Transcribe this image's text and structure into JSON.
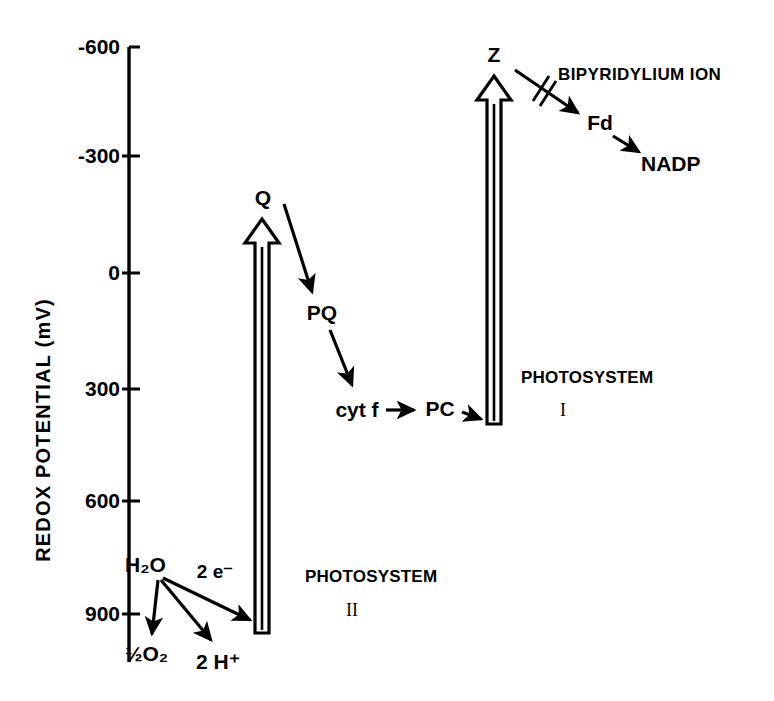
{
  "figure": {
    "type": "diagram",
    "background_color": "#ffffff",
    "ink_color": "#000000"
  },
  "axis": {
    "title_line1": "REDOX  POTENTIAL",
    "title_line2": "(mV)",
    "title_full": "REDOX  POTENTIAL   (mV)",
    "orientation": "vertical",
    "direction": "negative-at-top",
    "tick_labels": [
      "-600",
      "-300",
      "0",
      "300",
      "600",
      "900"
    ],
    "tick_values": [
      -600,
      -300,
      0,
      300,
      600,
      900
    ],
    "unit": "mV"
  },
  "photosystems": [
    {
      "key": "psii",
      "label_line1": "PHOTOSYSTEM",
      "label_line2": "II",
      "base_label": "",
      "top_label": "Q",
      "top_potential": -100,
      "base_potential": 820
    },
    {
      "key": "psi",
      "label_line1": "PHOTOSYSTEM",
      "label_line2": "I",
      "base_label": "",
      "top_label": "Z",
      "top_potential": -580,
      "base_potential": 390
    }
  ],
  "carriers": [
    {
      "key": "water",
      "label": "H2O",
      "display": "H₂O",
      "potential": 700
    },
    {
      "key": "oxygen",
      "label": "1/2 O2",
      "display": "½O₂",
      "potential": 870
    },
    {
      "key": "proton",
      "label": "2 H+",
      "display": "2 H⁺",
      "potential": 890
    },
    {
      "key": "electrons",
      "label": "2 e-",
      "display": "2 e⁻",
      "potential": 760
    },
    {
      "key": "q",
      "label": "Q",
      "display": "Q",
      "potential": -100
    },
    {
      "key": "pq",
      "label": "PQ",
      "display": "PQ",
      "potential": 100
    },
    {
      "key": "cytf",
      "label": "cyt f",
      "display": "cyt f",
      "potential": 370
    },
    {
      "key": "pc",
      "label": "PC",
      "display": "PC",
      "potential": 380
    },
    {
      "key": "z",
      "label": "Z",
      "display": "Z",
      "potential": -580
    },
    {
      "key": "fd",
      "label": "Fd",
      "display": "Fd",
      "potential": -420
    },
    {
      "key": "nadp",
      "label": "NADP",
      "display": "NADP",
      "potential": -320
    }
  ],
  "inhibitor": {
    "label": "BIPYRIDYLIUM  ION",
    "blocks_step": "Z to Fd",
    "marker": "double-slash"
  },
  "flows": [
    {
      "from": "H2O",
      "to": "1/2 O2",
      "label": ""
    },
    {
      "from": "H2O",
      "to": "2 H+",
      "label": ""
    },
    {
      "from": "H2O",
      "to": "PHOTOSYSTEM II",
      "label": "2 e-"
    },
    {
      "from": "Q",
      "to": "PQ",
      "label": ""
    },
    {
      "from": "PQ",
      "to": "cyt f",
      "label": ""
    },
    {
      "from": "cyt f",
      "to": "PC",
      "label": ""
    },
    {
      "from": "PC",
      "to": "PHOTOSYSTEM I",
      "label": ""
    },
    {
      "from": "Z",
      "to": "Fd",
      "label": ""
    },
    {
      "from": "Fd",
      "to": "NADP",
      "label": ""
    }
  ]
}
